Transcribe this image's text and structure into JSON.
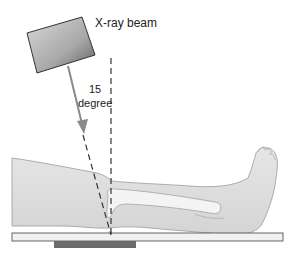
{
  "diagram": {
    "beam_label": "X-ray beam",
    "angle_value": "15",
    "angle_unit": "degree",
    "colors": {
      "tube_light": "#d8d8d8",
      "tube_dark": "#6a6a6a",
      "arrow": "#8a8a8a",
      "leg_fill": "#e2e2e2",
      "leg_outline": "#9a9a9a",
      "bone_fill": "#f4f4f4",
      "table_fill": "#f1f1f1",
      "table_outline": "#555555",
      "film": "#6b6b6b",
      "dashed_line": "#333333"
    },
    "elements": [
      "x-ray-tube",
      "beam-arrow",
      "vertical-reference-line",
      "angled-beam-line",
      "leg",
      "tibia",
      "table",
      "film-cassette"
    ]
  }
}
